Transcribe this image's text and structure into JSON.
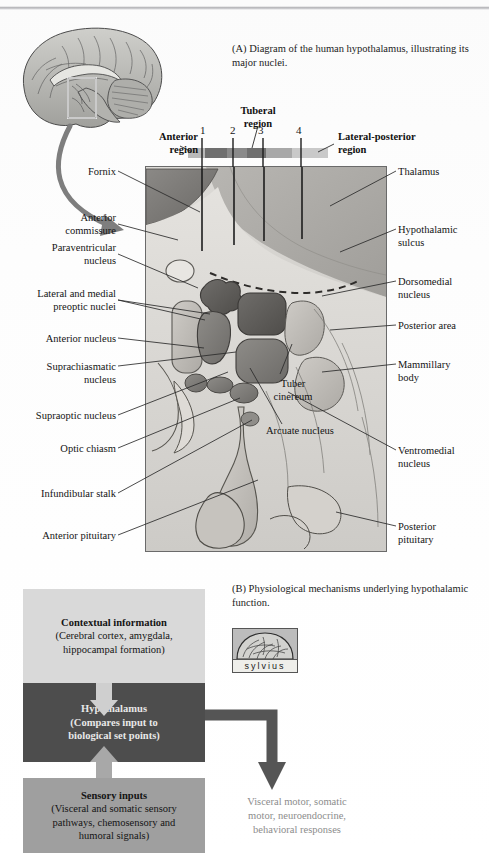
{
  "panel_a": {
    "caption": "(A) Diagram of the human hypothalamus, illustrating its major nuclei.",
    "region_bar": {
      "tick_numbers": [
        "1",
        "2",
        "3",
        "4"
      ],
      "labels": {
        "anterior": "Anterior\nregion",
        "tuberal": "Tuberal\nregion",
        "lateral_posterior": "Lateral-posterior\nregion"
      },
      "segment_colors": [
        "#b9b9b9",
        "#6f6f6f",
        "#8a8a8a",
        "#6f6f6f",
        "#a8a8a8",
        "#c9c9c9"
      ]
    },
    "labels_left": [
      "Fornix",
      "Anterior\ncommissure",
      "Paraventricular\nnucleus",
      "Lateral and medial\npreoptic nuclei",
      "Anterior nucleus",
      "Suprachiasmatic\nnucleus",
      "Supraoptic nucleus",
      "Optic chiasm",
      "Infundibular stalk",
      "Anterior pituitary"
    ],
    "labels_right": [
      "Thalamus",
      "Hypothalamic\nsulcus",
      "Dorsomedial\nnucleus",
      "Posterior area",
      "Mammillary\nbody",
      "Ventromedial\nnucleus",
      "Posterior\npituitary"
    ],
    "labels_inner": [
      "Tuber\ncinereum",
      "Arcuate nucleus"
    ]
  },
  "panel_b": {
    "caption": "(B) Physiological mechanisms underlying hypothalamic function.",
    "logo": {
      "word": "sylvius",
      "icon": "brain-icon"
    },
    "boxes": [
      {
        "title": "Contextual information",
        "detail": "(Cerebral cortex, amygdala,\nhippocampal formation)",
        "color": "#d9d9d9"
      },
      {
        "title": "Hypothalamus",
        "detail": "(Compares input to\nbiological set points)",
        "color": "#4d4d4d"
      },
      {
        "title": "Sensory inputs",
        "detail": "(Visceral and somatic sensory\npathways, chemosensory and\nhumoral signals)",
        "color": "#9f9f9f"
      }
    ],
    "output_text": "Visceral motor, somatic\nmotor, neuroendocrine,\nbehavioral responses"
  }
}
